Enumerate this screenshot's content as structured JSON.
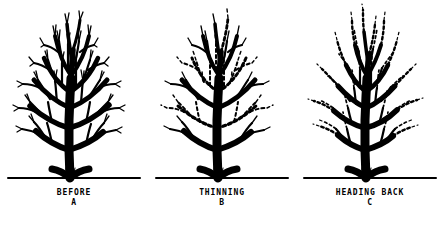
{
  "figure": {
    "background_color": "#ffffff",
    "ink_color": "#000000",
    "panel_count": 3
  },
  "panels": [
    {
      "id": "a",
      "caption_title": "BEFORE",
      "caption_letter": "A",
      "subject": "deciduous-tree-unpruned",
      "line_style": "solid",
      "description_visual": "full dense crown of solid branches and twigs"
    },
    {
      "id": "b",
      "caption_title": "THINNING",
      "caption_letter": "B",
      "subject": "deciduous-tree-thinning",
      "line_style": "solid-with-dashed-removals",
      "description_visual": "entire branches drawn dashed to show limbs removed at their point of origin"
    },
    {
      "id": "c",
      "caption_title": "HEADING BACK",
      "caption_letter": "C",
      "subject": "deciduous-tree-heading-back",
      "line_style": "solid-with-dashed-tips",
      "description_visual": "only outer branch tips drawn dashed to show shortened terminal growth"
    }
  ],
  "ground_line": {
    "label": "ground-line",
    "style": "horizontal rule under each tree"
  }
}
